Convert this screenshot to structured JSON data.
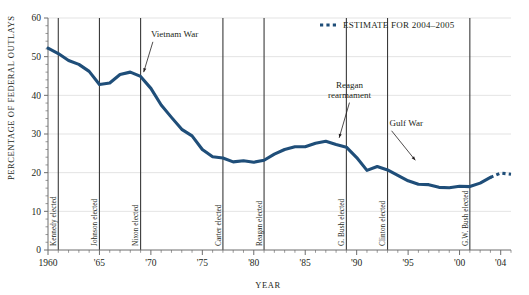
{
  "chart_data": {
    "type": "line",
    "title": "",
    "xlabel": "YEAR",
    "ylabel": "PERCENTAGE OF FEDERAL OUTLAYS",
    "xlim": [
      1960,
      2005
    ],
    "ylim": [
      0,
      60
    ],
    "y_ticks": [
      0,
      10,
      20,
      30,
      40,
      50,
      60
    ],
    "y_tick_labels": [
      "0",
      "10",
      "20",
      "30",
      "40",
      "50",
      "60"
    ],
    "x_ticks": [
      1960,
      1965,
      1970,
      1975,
      1980,
      1985,
      1990,
      1995,
      2000,
      2004
    ],
    "x_tick_labels": [
      "1960",
      "'65",
      "'70",
      "'75",
      "'80",
      "'85",
      "'90",
      "'95",
      "'00",
      "'04"
    ],
    "x_minor_tick_step": 1,
    "grid": "horizontal",
    "legend_position": "top-right",
    "series": [
      {
        "name": "Defense spending as percentage of federal outlays",
        "style": "solid",
        "color": "#1F4E79",
        "x": [
          1960,
          1961,
          1962,
          1963,
          1964,
          1965,
          1966,
          1967,
          1968,
          1969,
          1970,
          1971,
          1972,
          1973,
          1974,
          1975,
          1976,
          1977,
          1978,
          1979,
          1980,
          1981,
          1982,
          1983,
          1984,
          1985,
          1986,
          1987,
          1988,
          1989,
          1990,
          1991,
          1992,
          1993,
          1994,
          1995,
          1996,
          1997,
          1998,
          1999,
          2000,
          2001,
          2002,
          2003
        ],
        "values": [
          52.2,
          50.8,
          49.0,
          48.0,
          46.2,
          42.8,
          43.2,
          45.4,
          46.0,
          44.9,
          41.8,
          37.5,
          34.3,
          31.2,
          29.5,
          26.0,
          24.1,
          23.8,
          22.8,
          23.1,
          22.7,
          23.2,
          24.8,
          26.0,
          26.7,
          26.7,
          27.6,
          28.1,
          27.3,
          26.6,
          23.9,
          20.6,
          21.6,
          20.7,
          19.3,
          17.9,
          17.0,
          16.9,
          16.2,
          16.1,
          16.5,
          16.4,
          17.3,
          18.8
        ]
      },
      {
        "name": "ESTIMATE FOR 2004–2005",
        "style": "dotted",
        "color": "#1F4E79",
        "x": [
          2003,
          2004,
          2005
        ],
        "values": [
          18.8,
          19.9,
          19.6
        ]
      }
    ],
    "annotations": [
      {
        "id": "vietnam-war",
        "label": "Vietnam War",
        "text_x": 1970.0,
        "text_y": 55.0,
        "point_x": 1969.3,
        "point_y": 46.0
      },
      {
        "id": "reagan-rearmament",
        "label": "Reagan rearmament",
        "lines": [
          "Reagan",
          "rearmament"
        ],
        "text_x": 1989.3,
        "text_y": 42.0,
        "point_x": 1988.3,
        "point_y": 29.0
      },
      {
        "id": "gulf-war",
        "label": "Gulf War",
        "text_x": 1993.2,
        "text_y": 32.0,
        "point_x": 1995.7,
        "point_y": 23.2
      }
    ],
    "event_lines": [
      {
        "id": "kennedy-elected",
        "label": "Kennedy elected",
        "year": 1961
      },
      {
        "id": "johnson-elected",
        "label": "Johnson elected",
        "year": 1965
      },
      {
        "id": "nixon-elected",
        "label": "Nixon elected",
        "year": 1969
      },
      {
        "id": "carter-elected",
        "label": "Carter elected",
        "year": 1977
      },
      {
        "id": "reagan-elected",
        "label": "Reagan elected",
        "year": 1981
      },
      {
        "id": "g-bush-elected",
        "label": "G. Bush elected",
        "year": 1989
      },
      {
        "id": "clinton-elected",
        "label": "Clinton elected",
        "year": 1993
      },
      {
        "id": "gw-bush-elected",
        "label": "G.W. Bush elected",
        "year": 2001
      }
    ],
    "legend": [
      {
        "id": "estimate-legend",
        "label": "ESTIMATE FOR 2004–2005",
        "style": "dotted",
        "color": "#1F4E79"
      }
    ],
    "colors": {
      "line": "#1F4E79",
      "grid": "#dcdcdc",
      "axis": "#6d6d6d",
      "event_line": "#3a3a3a",
      "text": "#231f20",
      "background": "#ffffff"
    }
  }
}
